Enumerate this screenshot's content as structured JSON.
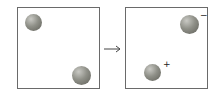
{
  "diagram": {
    "before": {
      "balls": [
        {
          "label": "sphere",
          "charge": ""
        },
        {
          "label": "sphere",
          "charge": ""
        }
      ]
    },
    "arrow": "→",
    "after": {
      "balls": [
        {
          "label": "sphere",
          "charge": "−"
        },
        {
          "label": "sphere",
          "charge": "+"
        }
      ]
    },
    "colors": {
      "border": "#6a6a6a",
      "sphere": "#8f9088"
    }
  }
}
